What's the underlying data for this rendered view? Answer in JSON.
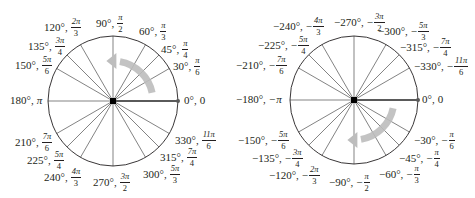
{
  "figure": {
    "colors": {
      "line": "#231f20",
      "spoke": "#4d4d4d",
      "ray": "#5a5a5a",
      "arrow": "#bdbdbd",
      "background": "#ffffff"
    }
  },
  "left_circle": {
    "direction": "counterclockwise",
    "center": [
      113,
      101
    ],
    "radius": 65,
    "angles_deg": [
      0,
      30,
      45,
      60,
      90,
      120,
      135,
      150,
      180,
      210,
      225,
      240,
      270,
      300,
      315,
      330
    ],
    "labels": [
      {
        "deg": "90°,",
        "sign": "",
        "num": "π",
        "den": "2"
      },
      {
        "deg": "60°,",
        "sign": "",
        "num": "π",
        "den": "3"
      },
      {
        "deg": "45°,",
        "sign": "",
        "num": "π",
        "den": "4"
      },
      {
        "deg": "30°,",
        "sign": "",
        "num": "π",
        "den": "6"
      },
      {
        "deg": "0°,",
        "plain": "0"
      },
      {
        "deg": "120°,",
        "sign": "",
        "num": "2π",
        "den": "3"
      },
      {
        "deg": "135°,",
        "sign": "",
        "num": "3π",
        "den": "4"
      },
      {
        "deg": "150°,",
        "sign": "",
        "num": "5π",
        "den": "6"
      },
      {
        "deg": "180°,",
        "plain": "π"
      },
      {
        "deg": "210°,",
        "sign": "",
        "num": "7π",
        "den": "6"
      },
      {
        "deg": "225°,",
        "sign": "",
        "num": "5π",
        "den": "4"
      },
      {
        "deg": "240°,",
        "sign": "",
        "num": "4π",
        "den": "3"
      },
      {
        "deg": "270°,",
        "sign": "",
        "num": "3π",
        "den": "2"
      },
      {
        "deg": "300°,",
        "sign": "",
        "num": "5π",
        "den": "3"
      },
      {
        "deg": "315°,",
        "sign": "",
        "num": "7π",
        "den": "4"
      },
      {
        "deg": "330°,",
        "sign": "",
        "num": "11π",
        "den": "6"
      }
    ]
  },
  "right_circle": {
    "direction": "clockwise",
    "center": [
      354,
      100
    ],
    "radius": 64,
    "angles_deg": [
      0,
      -30,
      -45,
      -60,
      -90,
      -120,
      -135,
      -150,
      -180,
      -210,
      -225,
      -240,
      -270,
      -300,
      -315,
      -330
    ],
    "labels": [
      {
        "deg": "−270°,",
        "sign": "−",
        "num": "3π",
        "den": "2"
      },
      {
        "deg": "−240°,",
        "sign": "−",
        "num": "4π",
        "den": "3"
      },
      {
        "deg": "−300°,",
        "sign": "−",
        "num": "5π",
        "den": "3"
      },
      {
        "deg": "−225°,",
        "sign": "−",
        "num": "5π",
        "den": "4"
      },
      {
        "deg": "−315°,",
        "sign": "−",
        "num": "7π",
        "den": "4"
      },
      {
        "deg": "−210°,",
        "sign": "−",
        "num": "7π",
        "den": "6"
      },
      {
        "deg": "−330°,",
        "sign": "−",
        "num": "11π",
        "den": "6"
      },
      {
        "deg": "−180°,",
        "plain": "−π"
      },
      {
        "deg": "0°,",
        "plain": "0"
      },
      {
        "deg": "−150°,",
        "sign": "−",
        "num": "5π",
        "den": "6"
      },
      {
        "deg": "−30°,",
        "sign": "−",
        "num": "π",
        "den": "6"
      },
      {
        "deg": "−135°,",
        "sign": "−",
        "num": "3π",
        "den": "4"
      },
      {
        "deg": "−45°,",
        "sign": "−",
        "num": "π",
        "den": "4"
      },
      {
        "deg": "−120°,",
        "sign": "−",
        "num": "2π",
        "den": "3"
      },
      {
        "deg": "−60°,",
        "sign": "−",
        "num": "π",
        "den": "3"
      },
      {
        "deg": "−90°,",
        "sign": "−",
        "num": "π",
        "den": "2"
      }
    ]
  }
}
